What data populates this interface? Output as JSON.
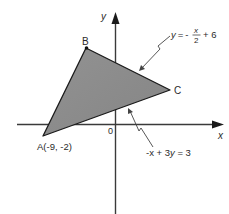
{
  "diagram": {
    "title": "",
    "axes": {
      "x_label": "x",
      "y_label": "y",
      "origin_label": "0"
    },
    "vertices": {
      "A": {
        "label": "A(-9, -2)",
        "name": "A",
        "x": -9,
        "y": -2
      },
      "B": {
        "label": "B",
        "name": "B"
      },
      "C": {
        "label": "C",
        "name": "C"
      }
    },
    "lines": {
      "bc": {
        "equation": "y = -x/2 + 6",
        "lhs": "y =",
        "sign": "-",
        "num": "x",
        "den": "2",
        "rhs": "+ 6"
      },
      "ac": {
        "equation": "-x + 3y = 3",
        "text_pre": "-x + 3",
        "text_var": "y",
        "text_post": " = 3"
      }
    },
    "colors": {
      "fill": "#8c8c8c",
      "stroke": "#1a1a1a",
      "axis": "#3a3a3a",
      "text": "#2a2a2a"
    }
  }
}
